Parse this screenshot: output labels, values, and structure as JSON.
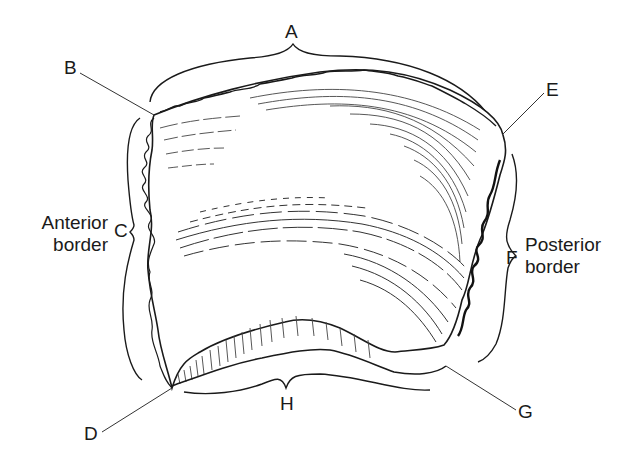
{
  "figure": {
    "labels": {
      "A": "A",
      "B": "B",
      "C": "C",
      "D": "D",
      "E": "E",
      "F": "F",
      "G": "G",
      "H": "H"
    },
    "annotations": {
      "anterior_line1": "Anterior",
      "anterior_line2": "border",
      "posterior_line1": "Posterior",
      "posterior_line2": "border"
    },
    "colors": {
      "ink": "#1a1a1a",
      "hatch": "#444444",
      "background": "#ffffff"
    }
  }
}
